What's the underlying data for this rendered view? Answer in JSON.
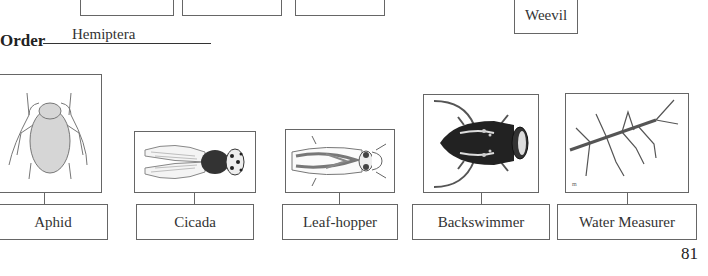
{
  "top_section": {
    "weevil_label": "Weevil"
  },
  "order": {
    "title": "Order",
    "value": "Hemiptera"
  },
  "insects": [
    {
      "name": "Aphid",
      "icon": "aphid-illustration"
    },
    {
      "name": "Cicada",
      "icon": "cicada-illustration"
    },
    {
      "name": "Leaf-hopper",
      "icon": "leafhopper-illustration"
    },
    {
      "name": "Backswimmer",
      "icon": "backswimmer-illustration"
    },
    {
      "name": "Water Measurer",
      "icon": "water-measurer-illustration"
    }
  ],
  "page_number": "81"
}
